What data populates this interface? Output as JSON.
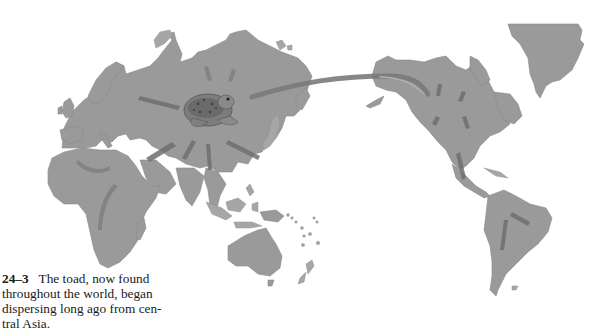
{
  "figure": {
    "number": "24–3",
    "caption": "The toad, now found throughout the world, began dispersing long ago from central Asia.",
    "caption_lines": [
      "The toad, now found",
      "throughout the world, began",
      "dispersing long ago from cen-",
      "tral Asia."
    ],
    "illustration": {
      "subject": "world-map-toad-dispersal",
      "origin_label_icon": "toad-icon",
      "land_color": "#9a9a9a",
      "arrow_color": "#6e6e6e",
      "regions": [
        "Europe",
        "Asia",
        "Africa",
        "Australia",
        "North America",
        "South America",
        "Greenland"
      ]
    }
  }
}
